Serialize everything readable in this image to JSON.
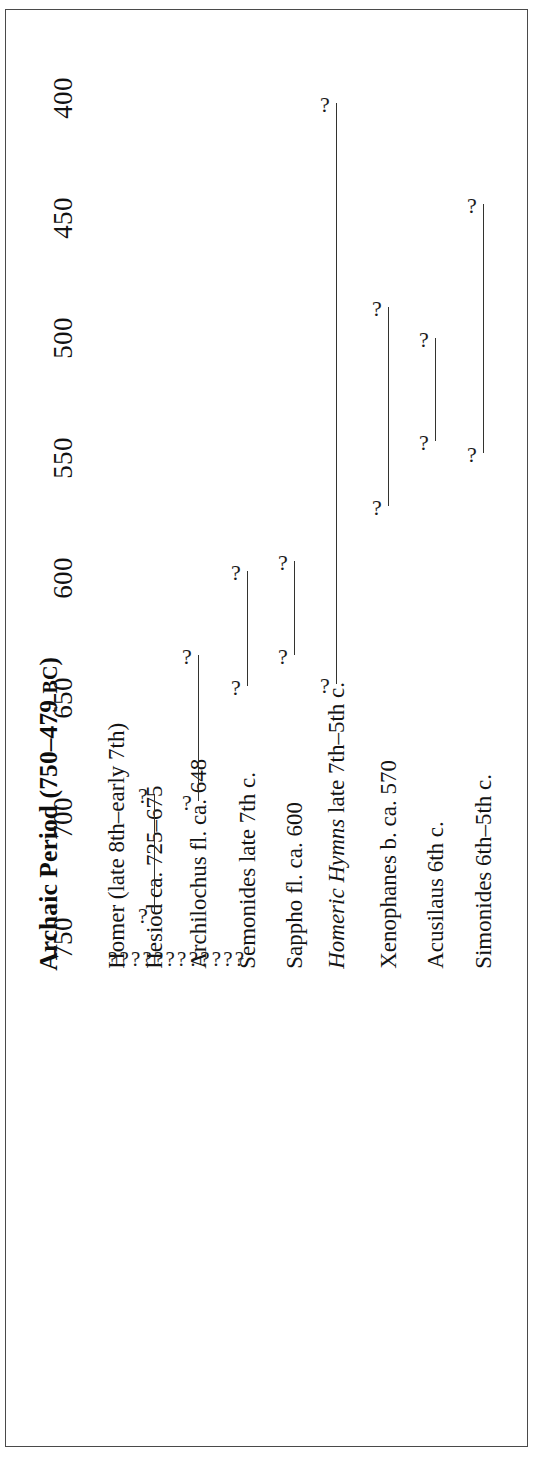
{
  "figure": {
    "title_main": "Archaic Period (750",
    "title_dash": "–",
    "title_years": "479",
    "title_era": "BC",
    "title_close": ")",
    "title_full": "Archaic Period (750–479 BC)",
    "frame_color": "#4a4a4a",
    "ink_color": "#1b1b1b",
    "uncertainty_glyph": "?"
  },
  "axis": {
    "label": "",
    "unit": "BC",
    "direction": "earliest at bottom, latest at top",
    "ticks": [
      {
        "label": "400",
        "value": 400
      },
      {
        "label": "450",
        "value": 450
      },
      {
        "label": "500",
        "value": 500
      },
      {
        "label": "550",
        "value": 550
      },
      {
        "label": "600",
        "value": 600
      },
      {
        "label": "650",
        "value": 650
      },
      {
        "label": "700",
        "value": 700
      },
      {
        "label": "750",
        "value": 750
      }
    ]
  },
  "rows": [
    {
      "name": "Homer",
      "label": "Homer (late 8th–early 7th)",
      "italic_prefix": "",
      "plain": "Homer (late 8th–early 7th)",
      "start": 755,
      "end": 688,
      "style": "question-run"
    },
    {
      "name": "Hesiod",
      "label": "Hesiod ca. 725–675",
      "italic_prefix": "",
      "plain": "Hesiod ca. 725–675",
      "start": 740,
      "end": 690,
      "style": "bar"
    },
    {
      "name": "Archilochus",
      "label": "Archilochus fl. ca. 648",
      "italic_prefix": "",
      "plain": "Archilochus fl. ca. 648",
      "start": 693,
      "end": 632,
      "style": "bar"
    },
    {
      "name": "Semonides",
      "label": "Semonides late 7th c.",
      "italic_prefix": "",
      "plain": "Semonides late 7th c.",
      "start": 645,
      "end": 597,
      "style": "bar"
    },
    {
      "name": "Sappho",
      "label": "Sappho fl. ca. 600",
      "italic_prefix": "",
      "plain": "Sappho fl. ca. 600",
      "start": 632,
      "end": 593,
      "style": "bar"
    },
    {
      "name": "Homeric Hymns",
      "label": "Homeric Hymns late 7th–5th c.",
      "italic_prefix": "Homeric Hymns",
      "plain": " late 7th–5th c.",
      "start": 644,
      "end": 402,
      "style": "bar"
    },
    {
      "name": "Xenophanes",
      "label": "Xenophanes b. ca. 570",
      "italic_prefix": "",
      "plain": "Xenophanes b. ca. 570",
      "start": 570,
      "end": 487,
      "style": "bar"
    },
    {
      "name": "Acusilaus",
      "label": "Acusilaus 6th c.",
      "italic_prefix": "",
      "plain": "Acusilaus 6th c.",
      "start": 543,
      "end": 500,
      "style": "bar"
    },
    {
      "name": "Simonides",
      "label": "Simonides 6th–5th c.",
      "italic_prefix": "",
      "plain": "Simonides 6th–5th c.",
      "start": 548,
      "end": 444,
      "style": "bar"
    }
  ],
  "chart_data": {
    "type": "timeline",
    "title": "Archaic Period (750–479 BC)",
    "xlabel": "",
    "ylabel": "Year BC",
    "axis_ticks": [
      400,
      450,
      500,
      550,
      600,
      650,
      700,
      750
    ],
    "axis_range": [
      760,
      392
    ],
    "axis_reversed": true,
    "grid": false,
    "legend": "none",
    "orientation": "page rotated 90° (landscape figure on a portrait page)",
    "note": "Each span is capped at both ends with a question mark indicating an uncertain date.",
    "categories": [
      "Homer (late 8th–early 7th)",
      "Hesiod ca. 725–675",
      "Archilochus fl. ca. 648",
      "Semonides late 7th c.",
      "Sappho fl. ca. 600",
      "Homeric Hymns late 7th–5th c.",
      "Xenophanes b. ca. 570",
      "Acusilaus 6th c.",
      "Simonides 6th–5th c."
    ],
    "spans": [
      {
        "category": "Homer (late 8th–early 7th)",
        "start": 755,
        "end": 688,
        "uncertain": true,
        "render": "dotted question marks"
      },
      {
        "category": "Hesiod ca. 725–675",
        "start": 740,
        "end": 690,
        "uncertain": true,
        "render": "line"
      },
      {
        "category": "Archilochus fl. ca. 648",
        "start": 693,
        "end": 632,
        "uncertain": true,
        "render": "line"
      },
      {
        "category": "Semonides late 7th c.",
        "start": 645,
        "end": 597,
        "uncertain": true,
        "render": "line"
      },
      {
        "category": "Sappho fl. ca. 600",
        "start": 632,
        "end": 593,
        "uncertain": true,
        "render": "line"
      },
      {
        "category": "Homeric Hymns late 7th–5th c.",
        "start": 644,
        "end": 402,
        "uncertain": true,
        "render": "line"
      },
      {
        "category": "Xenophanes b. ca. 570",
        "start": 570,
        "end": 487,
        "uncertain": true,
        "render": "line"
      },
      {
        "category": "Acusilaus 6th c.",
        "start": 543,
        "end": 500,
        "uncertain": true,
        "render": "line"
      },
      {
        "category": "Simonides 6th–5th c.",
        "start": 548,
        "end": 444,
        "uncertain": true,
        "render": "line"
      }
    ]
  }
}
